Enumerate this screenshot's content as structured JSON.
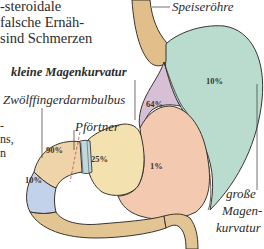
{
  "body_text": {
    "lines": [
      "-steroidale",
      "falsche Ernäh-",
      "sind Schmerzen"
    ],
    "fragments": [
      "-",
      "ns,",
      "n"
    ]
  },
  "labels": {
    "esophagus": "Speiseröhre",
    "lesser_curvature": "kleine Magenkurvatur",
    "duodenal_bulb": "Zwölffingerdarmbulbus",
    "pylorus": "Pförtner",
    "greater_curvature_1": "große",
    "greater_curvature_2": "Magen-",
    "greater_curvature_3": "kurvatur"
  },
  "regions": {
    "fundus_body": {
      "percent": "10%",
      "color": "#b9dccf"
    },
    "lesser_curvature": {
      "percent": "64%",
      "color": "#d7bfd6"
    },
    "antrum": {
      "percent": "1%",
      "color": "#f3c9b0"
    },
    "prepyloric": {
      "percent": "25%",
      "color": "#f3e2b0"
    },
    "duodenal_bulb": {
      "percent": "90%",
      "color": "#efd4a9"
    },
    "duodenum_descending": {
      "percent": "10%",
      "color": "#c2d2ea"
    },
    "esophagus": {
      "color": "#e2bf8a"
    },
    "duodenum_tail": {
      "color": "#e2c593"
    },
    "pylorus_ring": {
      "color": "#bfd9df"
    }
  }
}
